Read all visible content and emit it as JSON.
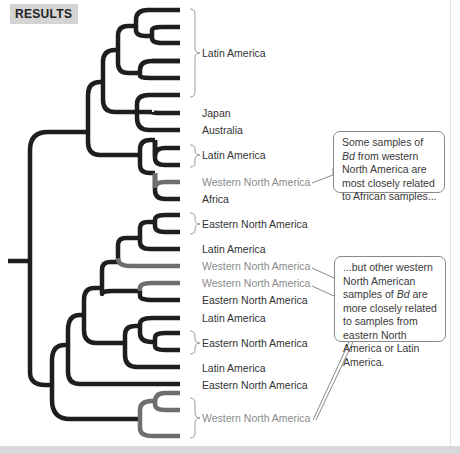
{
  "header": {
    "label": "RESULTS"
  },
  "colors": {
    "branch_dark": "#1e1e1e",
    "branch_gray": "#6e6e6e",
    "label_dark": "#333333",
    "label_gray": "#8a8a8a",
    "header_bg": "#d4d4d4"
  },
  "labels": [
    {
      "id": "latin-america-1",
      "text": "Latin America",
      "tone": "dark",
      "bracketed": true
    },
    {
      "id": "japan",
      "text": "Japan",
      "tone": "dark",
      "bracketed": false
    },
    {
      "id": "australia",
      "text": "Australia",
      "tone": "dark",
      "bracketed": false
    },
    {
      "id": "latin-america-2",
      "text": "Latin America",
      "tone": "dark",
      "bracketed": true
    },
    {
      "id": "western-na-1",
      "text": "Western North America",
      "tone": "gray",
      "bracketed": false
    },
    {
      "id": "africa",
      "text": "Africa",
      "tone": "dark",
      "bracketed": false
    },
    {
      "id": "eastern-na-1",
      "text": "Eastern North America",
      "tone": "dark",
      "bracketed": true
    },
    {
      "id": "latin-america-3",
      "text": "Latin America",
      "tone": "dark",
      "bracketed": false
    },
    {
      "id": "western-na-2",
      "text": "Western North America",
      "tone": "gray",
      "bracketed": false
    },
    {
      "id": "western-na-3",
      "text": "Western North America",
      "tone": "gray",
      "bracketed": false
    },
    {
      "id": "eastern-na-2",
      "text": "Eastern North America",
      "tone": "dark",
      "bracketed": false
    },
    {
      "id": "latin-america-4",
      "text": "Latin America",
      "tone": "dark",
      "bracketed": false
    },
    {
      "id": "eastern-na-3",
      "text": "Eastern North America",
      "tone": "dark",
      "bracketed": true
    },
    {
      "id": "latin-america-5",
      "text": "Latin America",
      "tone": "dark",
      "bracketed": false
    },
    {
      "id": "eastern-na-4",
      "text": "Eastern North America",
      "tone": "dark",
      "bracketed": false
    },
    {
      "id": "western-na-4",
      "text": "Western North America",
      "tone": "gray",
      "bracketed": true
    }
  ],
  "callouts": [
    {
      "id": "callout-african",
      "before": "Some samples of ",
      "italic": "Bd",
      "after": " from western North America are most closely related to African samples..."
    },
    {
      "id": "callout-other",
      "before": "...but other western North American samples of ",
      "italic": "Bd",
      "after": " are more closely related to samples from eastern North America or Latin America."
    }
  ]
}
